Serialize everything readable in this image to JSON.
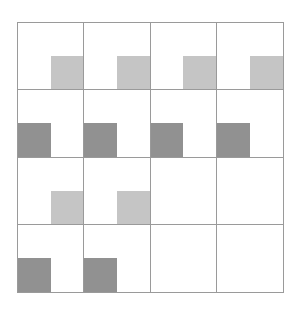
{
  "figure": {
    "type": "grid-shading-diagram",
    "rows": 4,
    "cols": 4,
    "colors": {
      "light_shade": "#c5c5c5",
      "dark_shade": "#919191",
      "grid_line": "#9a9a9a",
      "background": "#ffffff"
    },
    "shaded_quadrants": [
      {
        "row": 1,
        "col": 1,
        "shade": "light",
        "quadrant": "bottom-right"
      },
      {
        "row": 1,
        "col": 2,
        "shade": "light",
        "quadrant": "bottom-right"
      },
      {
        "row": 1,
        "col": 3,
        "shade": "light",
        "quadrant": "bottom-right"
      },
      {
        "row": 1,
        "col": 4,
        "shade": "light",
        "quadrant": "bottom-right"
      },
      {
        "row": 2,
        "col": 1,
        "shade": "dark",
        "quadrant": "bottom-left"
      },
      {
        "row": 2,
        "col": 2,
        "shade": "dark",
        "quadrant": "bottom-left"
      },
      {
        "row": 2,
        "col": 3,
        "shade": "dark",
        "quadrant": "bottom-left"
      },
      {
        "row": 2,
        "col": 4,
        "shade": "dark",
        "quadrant": "bottom-left"
      },
      {
        "row": 3,
        "col": 1,
        "shade": "light",
        "quadrant": "bottom-right"
      },
      {
        "row": 3,
        "col": 2,
        "shade": "light",
        "quadrant": "bottom-right"
      },
      {
        "row": 4,
        "col": 1,
        "shade": "dark",
        "quadrant": "bottom-left"
      },
      {
        "row": 4,
        "col": 2,
        "shade": "dark",
        "quadrant": "bottom-left"
      }
    ]
  }
}
